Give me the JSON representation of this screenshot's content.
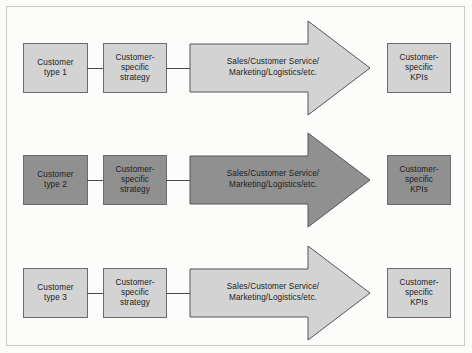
{
  "diagram": {
    "colors": {
      "fill_light": "#d3d3d3",
      "fill_dark": "#909090",
      "stroke": "#6b6b6b",
      "arrow_stroke": "#555555",
      "connector": "#4a4a4a",
      "text": "#1c1c1c",
      "page_background": "#fbfbfa",
      "frame_border": "#c9c9c7"
    },
    "rows": [
      {
        "id": "row-1",
        "shade": "light",
        "customer": {
          "line1": "Customer",
          "line2": "type 1"
        },
        "strategy": {
          "line1": "Customer-",
          "line2": "specific",
          "line3": "strategy"
        },
        "arrow": {
          "line1": "Sales/Customer Service/",
          "line2": "Marketing/Logistics/etc."
        },
        "kpi": {
          "line1": "Customer-",
          "line2": "specific",
          "line3": "KPIs"
        }
      },
      {
        "id": "row-2",
        "shade": "dark",
        "customer": {
          "line1": "Customer",
          "line2": "type 2"
        },
        "strategy": {
          "line1": "Customer-",
          "line2": "specific",
          "line3": "strategy"
        },
        "arrow": {
          "line1": "Sales/Customer Service/",
          "line2": "Marketing/Logistics/etc."
        },
        "kpi": {
          "line1": "Customer-",
          "line2": "specific",
          "line3": "KPIs"
        }
      },
      {
        "id": "row-3",
        "shade": "light",
        "customer": {
          "line1": "Customer",
          "line2": "type 3"
        },
        "strategy": {
          "line1": "Customer-",
          "line2": "specific",
          "line3": "strategy"
        },
        "arrow": {
          "line1": "Sales/Customer Service/",
          "line2": "Marketing/Logistics/etc."
        },
        "kpi": {
          "line1": "Customer-",
          "line2": "specific",
          "line3": "KPIs"
        }
      }
    ]
  }
}
